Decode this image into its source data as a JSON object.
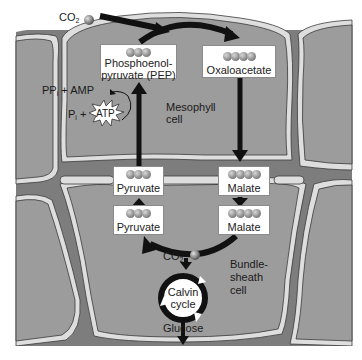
{
  "diagram": {
    "colors": {
      "background": "#ffffff",
      "cell_fill": "#9c9c9c",
      "intercellular_space": "#7d7d7d",
      "cell_wall": "#dedede",
      "wall_outline": "#3a3a3a",
      "arrow": "#111111",
      "box_fill": "#ffffff",
      "molecule_ball": "#9a9a9a"
    },
    "inputs": {
      "co2_top": {
        "label": "CO",
        "subscript": "2",
        "icon": "co2-molecule-ball"
      }
    },
    "cells": {
      "mesophyll": {
        "label_line1": "Mesophyll",
        "label_line2": "cell"
      },
      "bundle_sheath": {
        "label_line1": "Bundle-",
        "label_line2": "sheath",
        "label_line3": "cell"
      }
    },
    "molecules": {
      "pep": {
        "label_line1": "Phosphoenol-",
        "label_line2": "pyruvate (PEP)",
        "carbons": 3
      },
      "oxaloacetate": {
        "label": "Oxaloacetate",
        "carbons": 4
      },
      "malate_mesophyll": {
        "label": "Malate",
        "carbons": 4
      },
      "pyruvate_mesophyll": {
        "label": "Pyruvate",
        "carbons": 3
      },
      "malate_bundle": {
        "label": "Malate",
        "carbons": 4
      },
      "pyruvate_bundle": {
        "label": "Pyruvate",
        "carbons": 3
      }
    },
    "energy": {
      "ppi_amp": {
        "label": "PP",
        "subscript": "i",
        "suffix": " + AMP"
      },
      "pi": {
        "label": "P",
        "subscript": "i",
        "suffix": " +"
      },
      "atp": {
        "label": "ATP"
      }
    },
    "bundle_sheath_process": {
      "co2": {
        "label": "CO",
        "subscript": "2"
      },
      "calvin_line1": "Calvin",
      "calvin_line2": "cycle",
      "output": "Glucose"
    }
  }
}
